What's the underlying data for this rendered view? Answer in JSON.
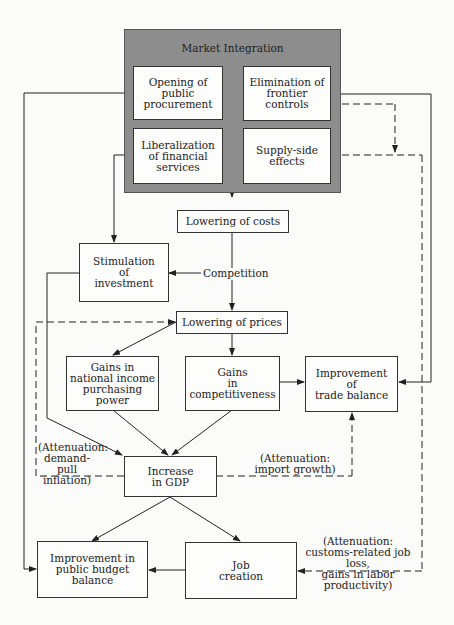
{
  "diagram": {
    "container": {
      "title": "Market Integration"
    },
    "inner_boxes": [
      {
        "id": "public-procurement",
        "label": "Opening of\npublic\nprocurement"
      },
      {
        "id": "frontier-controls",
        "label": "Elimination of\nfrontier\ncontrols"
      },
      {
        "id": "financial-services",
        "label": "Liberalization\nof financial\nservices"
      },
      {
        "id": "supply-side",
        "label": "Supply-side\neffects"
      }
    ],
    "nodes": {
      "lowering_costs": "Lowering of costs",
      "stimulation_investment": "Stimulation\nof\ninvestment",
      "competition": "Competition",
      "lowering_prices": "Lowering of prices",
      "gains_income": "Gains in\nnational income\npurchasing power",
      "gains_competitiveness": "Gains\nin\ncompetitiveness",
      "trade_balance": "Improvement\nof\ntrade balance",
      "increase_gdp": "Increase\nin GDP",
      "public_budget": "Improvement in\npublic budget\nbalance",
      "job_creation": "Job\ncreation"
    },
    "annotations": {
      "demand_pull": "(Attenuation:\ndemand-pull\ninflation)",
      "import_growth": "(Attenuation:\nimport growth)",
      "job_loss": "(Attenuation:\ncustoms-related job loss,\ngains in labor productivity)"
    },
    "colors": {
      "container_fill": "#8d8d8d",
      "box_fill": "#fdfdfc",
      "line": "#222222"
    }
  }
}
